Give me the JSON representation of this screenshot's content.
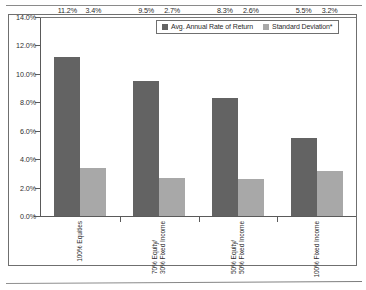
{
  "chart_data": {
    "type": "bar",
    "title": "",
    "xlabel": "",
    "ylabel": "",
    "ylim": [
      0,
      14
    ],
    "ytick_step": 2,
    "grid": false,
    "legend_position": "top-right-inside",
    "categories": [
      "100% Equities",
      "70% Equity/\n30% Fixed Income",
      "50% Equity/\n50% Fixed Income",
      "100% Fixed Income"
    ],
    "ytick_labels": [
      "0.0%",
      "2.0%",
      "4.0%",
      "6.0%",
      "8.0%",
      "10.0%",
      "12.0%",
      "14.0%"
    ],
    "series": [
      {
        "name": "Avg. Annual Rate of Return",
        "color": "#636363",
        "values": [
          11.2,
          9.5,
          8.3,
          5.5
        ],
        "labels": [
          "11.2%",
          "9.5%",
          "8.3%",
          "5.5%"
        ]
      },
      {
        "name": "Standard Deviation*",
        "color": "#a8a8a8",
        "values": [
          3.4,
          2.7,
          2.6,
          3.2
        ],
        "labels": [
          "3.4%",
          "2.7%",
          "2.6%",
          "3.2%"
        ]
      }
    ]
  },
  "axis": {
    "ticks": [
      {
        "label": "14.0%",
        "value": 14
      },
      {
        "label": "12.0%",
        "value": 12
      },
      {
        "label": "10.0%",
        "value": 10
      },
      {
        "label": "8.0%",
        "value": 8
      },
      {
        "label": "6.0%",
        "value": 6
      },
      {
        "label": "4.0%",
        "value": 4
      },
      {
        "label": "2.0%",
        "value": 2
      },
      {
        "label": "0.0%",
        "value": 0
      }
    ]
  },
  "legend": {
    "items": [
      {
        "label": "Avg. Annual Rate of Return",
        "swatch": "dark"
      },
      {
        "label": "Standard Deviation*",
        "swatch": "light"
      }
    ]
  },
  "categories_display": [
    {
      "line1": "100% Equities",
      "line2": ""
    },
    {
      "line1": "70% Equity/",
      "line2": "30% Fixed Income"
    },
    {
      "line1": "50% Equity/",
      "line2": "50% Fixed Income"
    },
    {
      "line1": "100% Fixed Income",
      "line2": ""
    }
  ]
}
